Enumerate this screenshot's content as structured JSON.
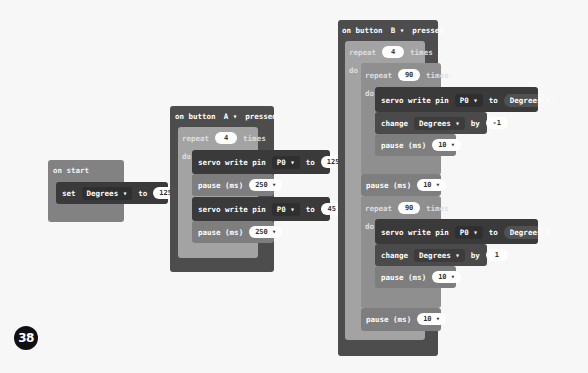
{
  "step_badge": "38",
  "on_start": {
    "header": "on start",
    "set_label": "set",
    "variable": "Degrees",
    "to_label": "to",
    "value": "125"
  },
  "button_a": {
    "header_prefix": "on button",
    "button": "A",
    "header_suffix": "pressed",
    "repeat_label": "repeat",
    "repeat_count": "4",
    "times_label": "times",
    "do_label": "do",
    "statements": [
      {
        "label": "servo write pin",
        "pin": "P0",
        "to_label": "to",
        "value": "125"
      },
      {
        "label": "pause (ms)",
        "value": "250"
      },
      {
        "label": "servo write pin",
        "pin": "P0",
        "to_label": "to",
        "value": "45"
      },
      {
        "label": "pause (ms)",
        "value": "250"
      }
    ]
  },
  "button_b": {
    "header_prefix": "on button",
    "button": "B",
    "header_suffix": "pressed",
    "outer_repeat": {
      "label": "repeat",
      "count": "4",
      "times": "times",
      "do": "do"
    },
    "inner_repeat_1": {
      "label": "repeat",
      "count": "90",
      "times": "times",
      "do": "do",
      "servo": {
        "label": "servo write pin",
        "pin": "P0",
        "to_label": "to",
        "value": "Degrees"
      },
      "change": {
        "label": "change",
        "variable": "Degrees",
        "by_label": "by",
        "value": "-1"
      },
      "pause": {
        "label": "pause (ms)",
        "value": "10"
      }
    },
    "pause_1": {
      "label": "pause (ms)",
      "value": "10"
    },
    "inner_repeat_2": {
      "label": "repeat",
      "count": "90",
      "times": "times",
      "do": "do",
      "servo": {
        "label": "servo write pin",
        "pin": "P0",
        "to_label": "to",
        "value": "Degrees"
      },
      "change": {
        "label": "change",
        "variable": "Degrees",
        "by_label": "by",
        "value": "1"
      },
      "pause": {
        "label": "pause (ms)",
        "value": "10"
      }
    },
    "pause_2": {
      "label": "pause (ms)",
      "value": "10"
    }
  },
  "icons": {
    "dropdown": "▾"
  }
}
